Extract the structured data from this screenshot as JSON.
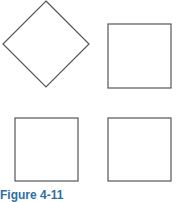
{
  "figure": {
    "caption": "Figure 4-11",
    "caption_color": "#2f6f9f",
    "stroke_color": "#555555",
    "shapes": [
      {
        "type": "diamond",
        "label": "rotated square",
        "points": "46,1 89,44 46,87 3,44"
      },
      {
        "type": "square",
        "x": 108,
        "y": 24,
        "w": 63,
        "h": 64
      },
      {
        "type": "square",
        "x": 15,
        "y": 118,
        "w": 63,
        "h": 63
      },
      {
        "type": "square",
        "x": 108,
        "y": 118,
        "w": 63,
        "h": 63
      }
    ]
  }
}
